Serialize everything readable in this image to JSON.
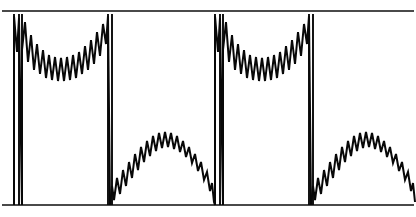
{
  "figure": {
    "width": 416,
    "height": 217,
    "background_color": "#ffffff",
    "trace_color": "#080808",
    "rule_color": "#4a4a4a"
  },
  "chart_data": {
    "type": "line",
    "subtitle": "",
    "xlabel": "",
    "ylabel": "",
    "xlim": [
      0,
      416
    ],
    "ylim": [
      0,
      217
    ],
    "grid": false,
    "legend": null,
    "axis_ticks": {
      "x": [],
      "y": []
    },
    "annotations": [],
    "rules": [
      {
        "name": "top-border",
        "orientation": "horizontal",
        "y": 11,
        "x_start": 2,
        "x_end": 414
      },
      {
        "name": "bottom-baseline",
        "orientation": "horizontal",
        "y": 205,
        "x_start": 2,
        "x_end": 414
      }
    ],
    "cycles": 2,
    "cycle_period": 201,
    "series": [
      {
        "name": "upper-plateau-cycle-1",
        "role": "damped-zigzag-plateau",
        "points": [
          [
            14,
            205
          ],
          [
            14,
            16
          ],
          [
            17,
            52
          ],
          [
            19,
            18
          ],
          [
            22,
            205
          ],
          [
            22,
            50
          ],
          [
            25,
            22
          ],
          [
            28,
            62
          ],
          [
            31,
            35
          ],
          [
            34,
            70
          ],
          [
            37,
            44
          ],
          [
            40,
            74
          ],
          [
            43,
            50
          ],
          [
            46,
            78
          ],
          [
            49,
            55
          ],
          [
            52,
            80
          ],
          [
            55,
            57
          ],
          [
            58,
            81
          ],
          [
            61,
            58
          ],
          [
            64,
            81
          ],
          [
            67,
            57
          ],
          [
            70,
            80
          ],
          [
            73,
            55
          ],
          [
            76,
            78
          ],
          [
            79,
            52
          ],
          [
            82,
            74
          ],
          [
            85,
            46
          ],
          [
            88,
            70
          ],
          [
            91,
            40
          ],
          [
            94,
            64
          ],
          [
            97,
            32
          ],
          [
            100,
            56
          ],
          [
            103,
            24
          ],
          [
            106,
            44
          ],
          [
            108,
            16
          ],
          [
            110,
            205
          ]
        ]
      },
      {
        "name": "lower-arch-cycle-1",
        "role": "arched-zigzag",
        "points": [
          [
            110,
            205
          ],
          [
            112,
            186
          ],
          [
            114,
            200
          ],
          [
            117,
            178
          ],
          [
            120,
            194
          ],
          [
            123,
            170
          ],
          [
            126,
            186
          ],
          [
            129,
            162
          ],
          [
            132,
            178
          ],
          [
            135,
            154
          ],
          [
            138,
            170
          ],
          [
            141,
            147
          ],
          [
            144,
            162
          ],
          [
            147,
            141
          ],
          [
            150,
            156
          ],
          [
            153,
            136
          ],
          [
            156,
            151
          ],
          [
            159,
            133
          ],
          [
            162,
            148
          ],
          [
            165,
            132
          ],
          [
            168,
            147
          ],
          [
            171,
            133
          ],
          [
            174,
            149
          ],
          [
            177,
            136
          ],
          [
            180,
            152
          ],
          [
            183,
            141
          ],
          [
            186,
            157
          ],
          [
            189,
            147
          ],
          [
            192,
            163
          ],
          [
            195,
            154
          ],
          [
            198,
            171
          ],
          [
            201,
            162
          ],
          [
            204,
            180
          ],
          [
            207,
            172
          ],
          [
            210,
            191
          ],
          [
            212,
            183
          ],
          [
            214,
            202
          ],
          [
            215,
            205
          ]
        ]
      },
      {
        "name": "upper-plateau-cycle-2",
        "role": "damped-zigzag-plateau",
        "points": [
          [
            215,
            205
          ],
          [
            215,
            16
          ],
          [
            218,
            52
          ],
          [
            220,
            18
          ],
          [
            223,
            205
          ],
          [
            223,
            50
          ],
          [
            226,
            22
          ],
          [
            229,
            62
          ],
          [
            232,
            35
          ],
          [
            235,
            70
          ],
          [
            238,
            44
          ],
          [
            241,
            74
          ],
          [
            244,
            50
          ],
          [
            247,
            78
          ],
          [
            250,
            55
          ],
          [
            253,
            80
          ],
          [
            256,
            57
          ],
          [
            259,
            81
          ],
          [
            262,
            58
          ],
          [
            265,
            81
          ],
          [
            268,
            57
          ],
          [
            271,
            80
          ],
          [
            274,
            55
          ],
          [
            277,
            78
          ],
          [
            280,
            52
          ],
          [
            283,
            74
          ],
          [
            286,
            46
          ],
          [
            289,
            70
          ],
          [
            292,
            40
          ],
          [
            295,
            64
          ],
          [
            298,
            32
          ],
          [
            301,
            56
          ],
          [
            304,
            24
          ],
          [
            307,
            44
          ],
          [
            309,
            16
          ],
          [
            311,
            205
          ]
        ]
      },
      {
        "name": "lower-arch-cycle-2",
        "role": "arched-zigzag",
        "points": [
          [
            311,
            205
          ],
          [
            313,
            186
          ],
          [
            315,
            200
          ],
          [
            318,
            178
          ],
          [
            321,
            194
          ],
          [
            324,
            170
          ],
          [
            327,
            186
          ],
          [
            330,
            162
          ],
          [
            333,
            178
          ],
          [
            336,
            154
          ],
          [
            339,
            170
          ],
          [
            342,
            147
          ],
          [
            345,
            162
          ],
          [
            348,
            141
          ],
          [
            351,
            156
          ],
          [
            354,
            136
          ],
          [
            357,
            151
          ],
          [
            360,
            133
          ],
          [
            363,
            148
          ],
          [
            366,
            132
          ],
          [
            369,
            147
          ],
          [
            372,
            133
          ],
          [
            375,
            149
          ],
          [
            378,
            136
          ],
          [
            381,
            152
          ],
          [
            384,
            141
          ],
          [
            387,
            157
          ],
          [
            390,
            147
          ],
          [
            393,
            163
          ],
          [
            396,
            154
          ],
          [
            399,
            171
          ],
          [
            402,
            162
          ],
          [
            405,
            180
          ],
          [
            408,
            172
          ],
          [
            411,
            191
          ],
          [
            413,
            183
          ],
          [
            415,
            202
          ]
        ]
      }
    ],
    "spikes": [
      {
        "name": "spike-1a",
        "x": 14,
        "y_top": 14,
        "y_bottom": 205
      },
      {
        "name": "spike-1b",
        "x": 19,
        "y_top": 14,
        "y_bottom": 205
      },
      {
        "name": "spike-1c",
        "x": 22,
        "y_top": 14,
        "y_bottom": 205
      },
      {
        "name": "spike-2a",
        "x": 108,
        "y_top": 14,
        "y_bottom": 205
      },
      {
        "name": "spike-2b",
        "x": 112,
        "y_top": 14,
        "y_bottom": 205
      },
      {
        "name": "spike-3a",
        "x": 215,
        "y_top": 14,
        "y_bottom": 205
      },
      {
        "name": "spike-3b",
        "x": 220,
        "y_top": 14,
        "y_bottom": 205
      },
      {
        "name": "spike-3c",
        "x": 223,
        "y_top": 14,
        "y_bottom": 205
      },
      {
        "name": "spike-4a",
        "x": 309,
        "y_top": 14,
        "y_bottom": 205
      },
      {
        "name": "spike-4b",
        "x": 313,
        "y_top": 14,
        "y_bottom": 205
      }
    ]
  }
}
